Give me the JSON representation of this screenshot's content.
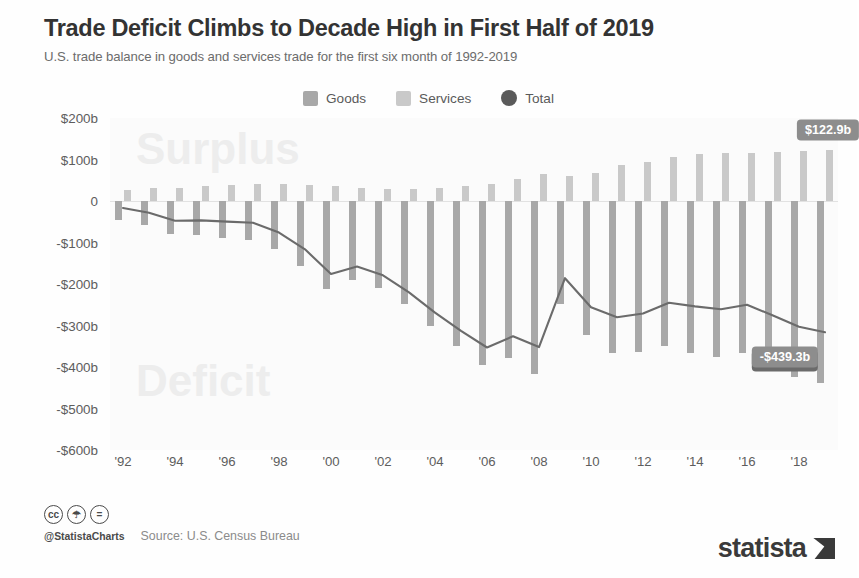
{
  "header": {
    "title": "Trade Deficit Climbs to Decade High in First Half of 2019",
    "subtitle": "U.S. trade balance in goods and services trade for the first six month of 1992-2019"
  },
  "legend": [
    {
      "label": "Goods",
      "swatch": "goods-swatch",
      "color": "#a8a8a8"
    },
    {
      "label": "Services",
      "swatch": "services-swatch",
      "color": "#c9c9c9"
    },
    {
      "label": "Total",
      "swatch": "total-swatch",
      "color": "#5a5a5a"
    }
  ],
  "watermarks": {
    "surplus": "Surplus",
    "deficit": "Deficit"
  },
  "footer": {
    "cc_icons": [
      "cc",
      "by",
      "nd"
    ],
    "handle": "@StatistaCharts",
    "source": "Source: U.S. Census Bureau",
    "logo_word": "statista"
  },
  "chart_data": {
    "type": "bar",
    "title": "Trade Deficit Climbs to Decade High in First Half of 2019",
    "subtitle": "U.S. trade balance in goods and services trade for the first six month of 1992-2019",
    "xlabel": "",
    "ylabel": "",
    "ylim": [
      -600,
      200
    ],
    "yticks": [
      200,
      100,
      0,
      -100,
      -200,
      -300,
      -400,
      -500,
      -600
    ],
    "ytick_labels": [
      "$200b",
      "$100b",
      "0",
      "-$100b",
      "-$200b",
      "-$300b",
      "-$400b",
      "-$500b",
      "-$600b"
    ],
    "unit": "billions of USD",
    "grid": false,
    "legend_position": "top-center",
    "categories": [
      1992,
      1993,
      1994,
      1995,
      1996,
      1997,
      1998,
      1999,
      2000,
      2001,
      2002,
      2003,
      2004,
      2005,
      2006,
      2007,
      2008,
      2009,
      2010,
      2011,
      2012,
      2013,
      2014,
      2015,
      2016,
      2017,
      2018,
      2019
    ],
    "xtick_labels": [
      "'92",
      "'94",
      "'96",
      "'98",
      "'00",
      "'02",
      "'04",
      "'06",
      "'08",
      "'10",
      "'12",
      "'14",
      "'16",
      "'18"
    ],
    "xtick_years": [
      1992,
      1994,
      1996,
      1998,
      2000,
      2002,
      2004,
      2006,
      2008,
      2010,
      2012,
      2014,
      2016,
      2018
    ],
    "series": [
      {
        "name": "Goods",
        "type": "bar",
        "color": "#a8a8a8",
        "values": [
          -44.6,
          -58.7,
          -79.8,
          -81.6,
          -89.2,
          -94.4,
          -116.5,
          -155.5,
          -212.0,
          -190.0,
          -209.0,
          -248.0,
          -301.0,
          -350.0,
          -395.0,
          -378.0,
          -416.0,
          -247.0,
          -324.0,
          -366.0,
          -365.0,
          -350.0,
          -367.0,
          -377.0,
          -366.0,
          -393.0,
          -423.0,
          -439.3
        ]
      },
      {
        "name": "Services",
        "type": "bar",
        "color": "#c9c9c9",
        "values": [
          27.7,
          30.4,
          32.1,
          35.0,
          39.6,
          42.0,
          40.5,
          39.0,
          36.0,
          32.0,
          30.0,
          28.0,
          32.0,
          37.0,
          42.0,
          52.0,
          64.0,
          61.0,
          68.0,
          86.0,
          94.0,
          105.0,
          113.0,
          116.0,
          116.0,
          117.0,
          120.0,
          122.9
        ]
      },
      {
        "name": "Total",
        "type": "line",
        "color": "#6b6b6b",
        "values": [
          -16.9,
          -28.3,
          -47.7,
          -46.6,
          -49.6,
          -52.4,
          -76.0,
          -116.5,
          -176.0,
          -158.0,
          -179.0,
          -220.0,
          -269.0,
          -313.0,
          -353.0,
          -326.0,
          -352.0,
          -186.0,
          -256.0,
          -280.0,
          -271.0,
          -245.0,
          -254.0,
          -261.0,
          -250.0,
          -276.0,
          -303.0,
          -316.3
        ]
      }
    ],
    "annotations": [
      {
        "text": "$122.9b",
        "series": "Services",
        "year": 2019,
        "value": 122.9,
        "style": "light"
      },
      {
        "text": "-$316.3b",
        "series": "Total",
        "year": 2019,
        "value": -316.3,
        "style": "dark"
      },
      {
        "text": "-$439.3b",
        "series": "Goods",
        "year": 2019,
        "value": -439.3,
        "style": "light"
      }
    ]
  }
}
